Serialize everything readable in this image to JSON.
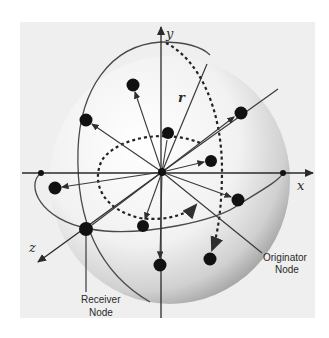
{
  "diagram": {
    "type": "3d-sphere-node-distribution",
    "axes": {
      "x": {
        "label": "x"
      },
      "y": {
        "label": "y"
      },
      "z": {
        "label": "z"
      }
    },
    "radius_label": "r",
    "annotations": {
      "originator": {
        "line1": "Originator",
        "line2": "Node"
      },
      "receiver": {
        "line1": "Receiver",
        "line2": "Node"
      }
    },
    "colors": {
      "background": "#efefef",
      "sphere_light": "#f7f7f7",
      "sphere_dark": "#9a9a9a",
      "lines": "#3a3a3a",
      "nodes": "#111111"
    },
    "center": {
      "x": 162,
      "y": 172
    },
    "nodes": [
      {
        "x": 133,
        "y": 85
      },
      {
        "x": 86,
        "y": 120
      },
      {
        "x": 168,
        "y": 133
      },
      {
        "x": 241,
        "y": 113
      },
      {
        "x": 211,
        "y": 161
      },
      {
        "x": 55,
        "y": 188
      },
      {
        "x": 238,
        "y": 200
      },
      {
        "x": 143,
        "y": 226
      },
      {
        "x": 86,
        "y": 229
      },
      {
        "x": 160,
        "y": 265
      },
      {
        "x": 210,
        "y": 259
      }
    ]
  }
}
